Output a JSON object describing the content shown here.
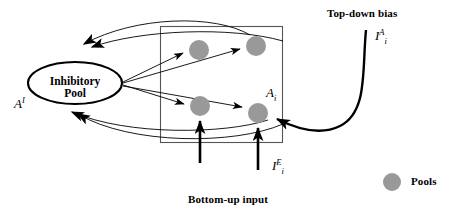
{
  "figure": {
    "labels": {
      "inhibitory_pool_line1": "Inhibitory",
      "inhibitory_pool_line2": "Pool",
      "inhibitory_pool_symbol_base": "A",
      "inhibitory_pool_symbol_sup": "I",
      "excitatory_pool_symbol_base": "A",
      "excitatory_pool_symbol_sub": "i",
      "top_down_bias_title": "Top-down bias",
      "top_down_bias_symbol_base": "I",
      "top_down_bias_symbol_sub": "i",
      "top_down_bias_symbol_sup": "A",
      "bottom_up_input_title": "Bottom-up input",
      "bottom_up_input_symbol_base": "I",
      "bottom_up_input_symbol_sub": "i",
      "bottom_up_input_symbol_sup": "E",
      "legend_pools": "Pools"
    },
    "colors": {
      "pool_fill": "#999999",
      "stroke": "#000000",
      "box_stroke": "#555555",
      "background": "#ffffff"
    },
    "pools": [
      {
        "name": "pool-top-left",
        "cx": 199,
        "cy": 50,
        "r": 10
      },
      {
        "name": "pool-top-right",
        "cx": 256,
        "cy": 46,
        "r": 10
      },
      {
        "name": "pool-bottom-left",
        "cx": 200,
        "cy": 106,
        "r": 10
      },
      {
        "name": "pool-bottom-right",
        "cx": 258,
        "cy": 113,
        "r": 10
      }
    ],
    "legend_marker": {
      "cx": 392,
      "cy": 182,
      "r": 9
    },
    "module_box": {
      "x": 160,
      "y": 26,
      "width": 123,
      "height": 117
    },
    "inhibitory_ellipse": {
      "cx": 75,
      "cy": 83,
      "rx": 47,
      "ry": 21
    }
  }
}
